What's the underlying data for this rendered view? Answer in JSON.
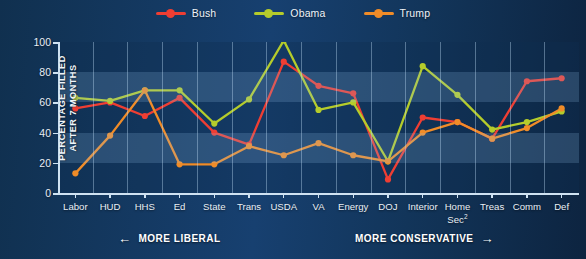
{
  "chart_data": {
    "type": "line",
    "title": "",
    "xlabel": "",
    "ylabel": "PERCENTAGE FILLED AFTER 7 MONTHS",
    "ylabel_line1": "PERCENTAGE FILLED",
    "ylabel_line2": "AFTER 7 MONTHS",
    "ylim": [
      0,
      100
    ],
    "yticks": [
      0,
      20,
      40,
      60,
      80,
      100
    ],
    "ytick_labels": [
      "0",
      "20",
      "40",
      "60",
      "80",
      "100"
    ],
    "grid": "vertical",
    "legend_position": "top-center",
    "categories": [
      "Labor",
      "HUD",
      "HHS",
      "Ed",
      "State",
      "Trans",
      "USDA",
      "VA",
      "Energy",
      "DOJ",
      "Interior",
      "Home Sec²",
      "Treas",
      "Comm",
      "Def"
    ],
    "category_labels_multiline": [
      [
        "Labor"
      ],
      [
        "HUD"
      ],
      [
        "HHS"
      ],
      [
        "Ed"
      ],
      [
        "State"
      ],
      [
        "Trans"
      ],
      [
        "USDA"
      ],
      [
        "VA"
      ],
      [
        "Energy"
      ],
      [
        "DOJ"
      ],
      [
        "Interior"
      ],
      [
        "Home",
        "Sec²"
      ],
      [
        "Treas"
      ],
      [
        "Comm"
      ],
      [
        "Def"
      ]
    ],
    "series": [
      {
        "name": "Bush",
        "color": "#ef3e33",
        "values": [
          56,
          60,
          51,
          63,
          40,
          32,
          87,
          71,
          66,
          9,
          50,
          47,
          36,
          74,
          76
        ]
      },
      {
        "name": "Obama",
        "color": "#b5cc2b",
        "values": [
          63,
          61,
          68,
          68,
          46,
          62,
          101,
          55,
          60,
          21,
          84,
          65,
          42,
          47,
          54
        ]
      },
      {
        "name": "Trump",
        "color": "#f08c28",
        "values": [
          13,
          38,
          68,
          19,
          19,
          31,
          25,
          33,
          25,
          21,
          40,
          47,
          36,
          43,
          56
        ]
      }
    ],
    "annotations": [
      {
        "id": "more-liberal",
        "text": "MORE LIBERAL",
        "arrow": "←",
        "arrow_side": "left"
      },
      {
        "id": "more-conservative",
        "text": "MORE CONSERVATIVE",
        "arrow": "→",
        "arrow_side": "right"
      }
    ],
    "background_bands": [
      {
        "from": 20,
        "to": 40,
        "shade": "light"
      },
      {
        "from": 60,
        "to": 80,
        "shade": "light"
      }
    ]
  },
  "legend": {
    "items": [
      {
        "label": "Bush",
        "color": "#ef3e33"
      },
      {
        "label": "Obama",
        "color": "#b5cc2b"
      },
      {
        "label": "Trump",
        "color": "#f08c28"
      }
    ]
  },
  "colors": {
    "background": "#123css",
    "plot_background": "#15395e",
    "band": "#2a5b8c",
    "axis": "#cfe2f2",
    "grid": "#bedcf5",
    "text": "#eef3f8",
    "bush": "#ef3e33",
    "obama": "#b5cc2b",
    "trump": "#f08c28"
  }
}
